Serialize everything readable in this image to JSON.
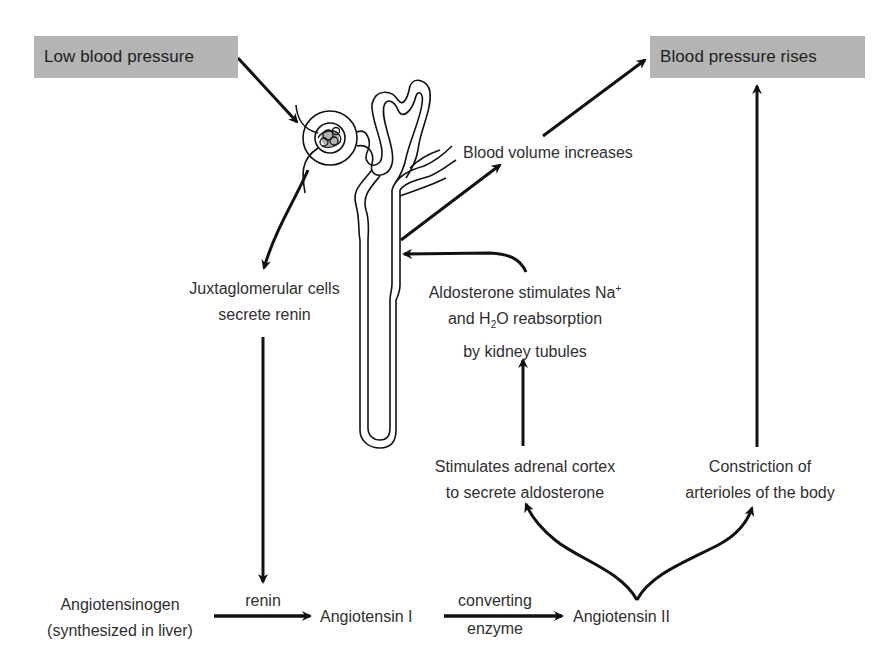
{
  "boxes": {
    "low_bp": "Low blood pressure",
    "bp_rises": "Blood pressure rises"
  },
  "labels": {
    "blood_volume": "Blood volume increases",
    "jg_cells": {
      "line1": "Juxtaglomerular cells",
      "line2": "secrete renin"
    },
    "aldosterone_effect": {
      "line1_prefix": "Aldosterone stimulates Na",
      "line1_sup": "+",
      "line2_prefix": "and H",
      "line2_sub": "2",
      "line2_suffix": "O reabsorption",
      "line3": "by kidney tubules"
    },
    "adrenal": {
      "line1": "Stimulates adrenal cortex",
      "line2": "to secrete aldosterone"
    },
    "constriction": {
      "line1": "Constriction of",
      "line2": "arterioles of the body"
    },
    "angiotensinogen": {
      "line1": "Angiotensinogen",
      "line2": "(synthesized in liver)"
    },
    "renin": "renin",
    "angiotensin1": "Angiotensin I",
    "converting": "converting",
    "enzyme": "enzyme",
    "angiotensin2": "Angiotensin II"
  },
  "colors": {
    "box_fill": "#b4b4b4",
    "line": "#111111",
    "text": "#2f2f2f"
  },
  "icons": {
    "nephron": "kidney-nephron-illustration"
  }
}
